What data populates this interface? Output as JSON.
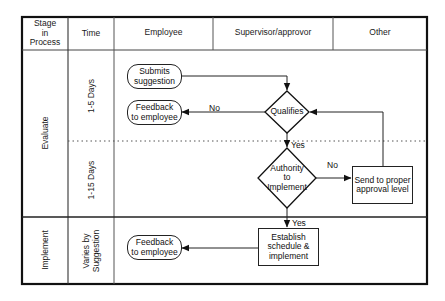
{
  "diagram": {
    "type": "swimlane-flowchart",
    "headers": {
      "stage": "Stage\nin\nProcess",
      "time": "Time",
      "lanes": [
        "Employee",
        "Supervisor/approvor",
        "Other"
      ]
    },
    "stages": [
      {
        "name": "Evaluate",
        "times": [
          "1-5 Days",
          "1-15 Days"
        ]
      },
      {
        "name": "Implement",
        "times": [
          "Varies by\nSuggestion"
        ]
      }
    ],
    "nodes": [
      {
        "id": "submits",
        "shape": "terminator",
        "lane": "Employee",
        "label": "Submits\nsuggestion"
      },
      {
        "id": "qualifies",
        "shape": "decision",
        "lane": "Supervisor/approvor",
        "label": "Qualifies"
      },
      {
        "id": "feedback1",
        "shape": "terminator",
        "lane": "Employee",
        "label": "Feedback\nto employee"
      },
      {
        "id": "authority",
        "shape": "decision",
        "lane": "Supervisor/approvor",
        "label": "Authority\nto\nImplement"
      },
      {
        "id": "send",
        "shape": "process",
        "lane": "Other",
        "label": "Send to proper\napproval level"
      },
      {
        "id": "establish",
        "shape": "process",
        "lane": "Supervisor/approvor",
        "label": "Establish\nschedule &\nimplement"
      },
      {
        "id": "feedback2",
        "shape": "terminator",
        "lane": "Employee",
        "label": "Feedback\nto employee"
      }
    ],
    "edges": [
      {
        "from": "submits",
        "to": "qualifies",
        "label": ""
      },
      {
        "from": "qualifies",
        "to": "feedback1",
        "label": "No"
      },
      {
        "from": "qualifies",
        "to": "authority",
        "label": "Yes"
      },
      {
        "from": "authority",
        "to": "send",
        "label": "No"
      },
      {
        "from": "send",
        "to": "qualifies",
        "label": ""
      },
      {
        "from": "authority",
        "to": "establish",
        "label": "Yes"
      },
      {
        "from": "establish",
        "to": "feedback2",
        "label": ""
      }
    ],
    "edge_labels": {
      "no1": "No",
      "yes1": "Yes",
      "no2": "No",
      "yes2": "Yes"
    },
    "colors": {
      "line": "#222222",
      "background": "#ffffff"
    }
  }
}
